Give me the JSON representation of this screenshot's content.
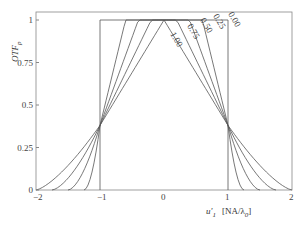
{
  "chart_data": {
    "type": "line",
    "title": "",
    "xlabel": "u'1 [NA/λ0]",
    "ylabel": "OTF_p",
    "xlim": [
      -2,
      2
    ],
    "ylim": [
      0,
      1
    ],
    "x_ticks": [
      "-2",
      "-1",
      "0",
      "1",
      "2"
    ],
    "y_ticks": [
      "0",
      "0.25",
      "0.5",
      "0.75",
      "1"
    ],
    "grid": false,
    "series": [
      {
        "name": "0.00",
        "points": [
          [
            -1,
            0
          ],
          [
            -1,
            1
          ],
          [
            1,
            1
          ],
          [
            1,
            0
          ]
        ]
      },
      {
        "name": "0.25",
        "points": [
          [
            -1.25,
            0
          ],
          [
            -1,
            0.38
          ],
          [
            -0.55,
            1
          ],
          [
            0,
            1
          ],
          [
            0.55,
            1
          ],
          [
            1,
            0.38
          ],
          [
            1.25,
            0
          ]
        ]
      },
      {
        "name": "0.50",
        "points": [
          [
            -1.5,
            0
          ],
          [
            -1,
            0.38
          ],
          [
            -0.35,
            1
          ],
          [
            0,
            1
          ],
          [
            0.35,
            1
          ],
          [
            1,
            0.38
          ],
          [
            1.5,
            0
          ]
        ]
      },
      {
        "name": "0.75",
        "points": [
          [
            -1.75,
            0
          ],
          [
            -1,
            0.38
          ],
          [
            -0.18,
            1
          ],
          [
            0,
            1
          ],
          [
            0.18,
            1
          ],
          [
            1,
            0.38
          ],
          [
            1.75,
            0
          ]
        ]
      },
      {
        "name": "1.00",
        "points": [
          [
            -2,
            0
          ],
          [
            -1,
            0.38
          ],
          [
            0,
            1
          ],
          [
            1,
            0.38
          ],
          [
            2,
            0
          ]
        ]
      }
    ],
    "annotations": [
      "0.00",
      "0.25",
      "0.50",
      "0.75",
      "1.00"
    ]
  },
  "labels": {
    "y_axis": "OTF",
    "y_axis_sub": "p",
    "x_axis": "u'",
    "x_axis_sub": "1",
    "x_unit": "[NA/λ",
    "x_unit_sub": "0",
    "x_unit_end": "]"
  }
}
